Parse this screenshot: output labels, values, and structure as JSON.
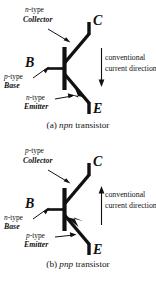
{
  "figure": {
    "background": "#ffffff",
    "ink": "#111111"
  },
  "panels": [
    {
      "id": "npn",
      "caption_prefix": "(a) ",
      "caption_italic": "npn",
      "caption_suffix": " transistor",
      "collector": {
        "doping_italic": "n",
        "doping_rest": "-type",
        "region": "Collector",
        "terminal": "C"
      },
      "base": {
        "doping_italic": "p",
        "doping_rest": "-type",
        "region": "Base",
        "terminal": "B"
      },
      "emitter": {
        "doping_italic": "n",
        "doping_rest": "-type",
        "region": "Emitter",
        "terminal": "E"
      },
      "current_note": {
        "line1": "conventional",
        "line2": "current direction",
        "arrow_direction": "down"
      }
    },
    {
      "id": "pnp",
      "caption_prefix": "(b) ",
      "caption_italic": "pnp",
      "caption_suffix": " transistor",
      "collector": {
        "doping_italic": "p",
        "doping_rest": "-type",
        "region": "Collector",
        "terminal": "C"
      },
      "base": {
        "doping_italic": "n",
        "doping_rest": "-type",
        "region": "Base",
        "terminal": "B"
      },
      "emitter": {
        "doping_italic": "p",
        "doping_rest": "-type",
        "region": "Emitter",
        "terminal": "E"
      },
      "current_note": {
        "line1": "conventional",
        "line2": "current direction",
        "arrow_direction": "up"
      }
    }
  ]
}
